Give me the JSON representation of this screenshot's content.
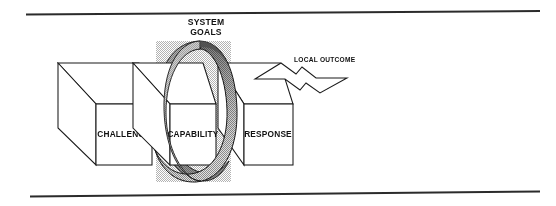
{
  "figure": {
    "title_label": "SYSTEM GOALS",
    "title_line1": "SYSTEM",
    "title_line2": "GOALS",
    "outcome_label": "LOCAL OUTCOME",
    "boxes": [
      {
        "id": "challenge",
        "label": "CHALLENGE"
      },
      {
        "id": "capability",
        "label": "CAPABILITY"
      },
      {
        "id": "response",
        "label": "RESPONSE"
      }
    ],
    "colors": {
      "ink": "#1a1a1a",
      "rule": "#2b2b2b",
      "box_fill": "#ffffff",
      "ring_dark": "#6f6f6f",
      "ring_mid": "#a5a5a5",
      "ring_light": "#d8d8d8",
      "background": "#ffffff"
    }
  }
}
